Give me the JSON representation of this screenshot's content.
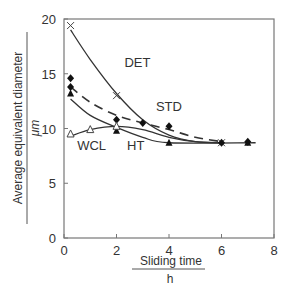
{
  "chart_data": {
    "type": "line",
    "title": "",
    "xlabel": "Sliding time",
    "xunit": "h",
    "ylabel": "Average equivalent diameter",
    "yunit": "μm",
    "xlim": [
      0,
      8
    ],
    "ylim": [
      0,
      20
    ],
    "xticks": [
      0,
      2,
      4,
      6,
      8
    ],
    "yticks": [
      0,
      5,
      10,
      15,
      20
    ],
    "grid": false,
    "legend_position": "inline labels",
    "series": [
      {
        "name": "DET",
        "marker": "cross",
        "line": "solid",
        "points": [
          [
            0.25,
            19.4
          ],
          [
            2,
            13.0
          ],
          [
            6,
            8.7
          ]
        ],
        "curve": [
          [
            0.25,
            19.0
          ],
          [
            1,
            16.3
          ],
          [
            2,
            13.2
          ],
          [
            3,
            10.8
          ],
          [
            4,
            9.4
          ],
          [
            5,
            8.8
          ],
          [
            6,
            8.7
          ]
        ]
      },
      {
        "name": "STD",
        "marker": "diamond",
        "line": "dashed",
        "points": [
          [
            0.25,
            14.6
          ],
          [
            0.25,
            13.8
          ],
          [
            2,
            10.8
          ],
          [
            3,
            10.5
          ],
          [
            4,
            10.2
          ],
          [
            6,
            8.7
          ],
          [
            7,
            8.8
          ]
        ],
        "curve": [
          [
            0.25,
            13.8
          ],
          [
            1,
            12.4
          ],
          [
            2,
            11.2
          ],
          [
            3,
            10.5
          ],
          [
            4,
            9.9
          ],
          [
            5,
            9.2
          ],
          [
            6,
            8.8
          ]
        ]
      },
      {
        "name": "HT",
        "marker": "filled-triangle",
        "line": "solid",
        "points": [
          [
            0.25,
            13.2
          ],
          [
            2,
            9.8
          ],
          [
            4,
            8.7
          ],
          [
            7,
            8.7
          ]
        ],
        "curve": [
          [
            0.25,
            12.7
          ],
          [
            1,
            11.2
          ],
          [
            2,
            10.1
          ],
          [
            3,
            9.2
          ],
          [
            4,
            8.7
          ],
          [
            7.3,
            8.7
          ]
        ]
      },
      {
        "name": "WCL",
        "marker": "open-triangle",
        "line": "solid",
        "points": [
          [
            0.25,
            9.5
          ],
          [
            1,
            9.9
          ],
          [
            2,
            10.2
          ]
        ],
        "curve": [
          [
            0.25,
            9.3
          ],
          [
            1,
            9.9
          ],
          [
            2,
            10.2
          ],
          [
            3,
            9.9
          ],
          [
            4,
            9.2
          ],
          [
            5,
            8.8
          ],
          [
            6,
            8.7
          ]
        ]
      }
    ],
    "annotations": [
      {
        "text": "DET",
        "x": 2.3,
        "y": 15.6
      },
      {
        "text": "STD",
        "x": 3.5,
        "y": 11.6
      },
      {
        "text": "WCL",
        "x": 0.5,
        "y": 8.0
      },
      {
        "text": "HT",
        "x": 2.4,
        "y": 8.0
      }
    ]
  }
}
